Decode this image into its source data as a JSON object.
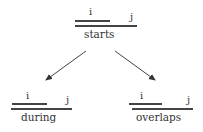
{
  "diagram": {
    "root": {
      "name": "starts",
      "interval_i_label": "i",
      "interval_j_label": "j"
    },
    "children": [
      {
        "name": "during",
        "interval_i_label": "i",
        "interval_j_label": "j"
      },
      {
        "name": "overlaps",
        "interval_i_label": "i",
        "interval_j_label": "j"
      }
    ],
    "edges": [
      {
        "from": "starts",
        "to": "during"
      },
      {
        "from": "starts",
        "to": "overlaps"
      }
    ],
    "colors": {
      "line": "#444444",
      "text": "#333333",
      "arrow": "#333333"
    }
  }
}
